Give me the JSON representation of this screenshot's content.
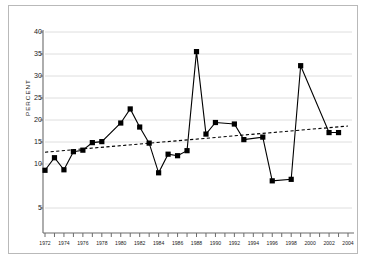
{
  "chart_data": {
    "type": "line",
    "title": "",
    "xlabel": "",
    "ylabel": "PERCENT",
    "ylim": [
      0,
      40
    ],
    "yticks": [
      5,
      10,
      15,
      20,
      25,
      30,
      35,
      40
    ],
    "ytick_labels": [
      "5",
      "10",
      "15",
      "20",
      "25",
      "30",
      "35",
      "40"
    ],
    "xlim": [
      1972,
      2004
    ],
    "xticks": [
      1972,
      1973,
      1974,
      1975,
      1976,
      1977,
      1978,
      1979,
      1980,
      1981,
      1982,
      1983,
      1984,
      1985,
      1986,
      1987,
      1988,
      1989,
      1990,
      1991,
      1992,
      1993,
      1994,
      1995,
      1996,
      1997,
      1998,
      1999,
      2000,
      2001,
      2002,
      2003,
      2004
    ],
    "xtick_labels_shown": [
      "1972",
      "1974",
      "1976",
      "1978",
      "1982",
      "1984",
      "1986",
      "1988",
      "1990",
      "1992",
      "1996",
      "2000",
      "2004"
    ],
    "grid": "horizontal",
    "legend": "none",
    "x": [
      1972,
      1973,
      1974,
      1975,
      1976,
      1977,
      1978,
      1979,
      1980,
      1981,
      1982,
      1983,
      1984,
      1985,
      1986,
      1987,
      1988,
      1989,
      1990,
      1991,
      1992,
      1993,
      1994,
      1995,
      1996,
      1997,
      1998,
      1999,
      2000,
      2001,
      2002,
      2003,
      2004
    ],
    "series": [
      {
        "name": "percent",
        "style": "solid-line-with-square-markers",
        "color": "#000000",
        "x": [
          1972,
          1973,
          1974,
          1975,
          1976,
          1977,
          1978,
          1980,
          1981,
          1982,
          1983,
          1984,
          1985,
          1986,
          1987,
          1988,
          1989,
          1990,
          1992,
          1993,
          1995,
          1996,
          1998,
          1999,
          2002,
          2003
        ],
        "values": [
          12.5,
          15.0,
          12.6,
          16.2,
          16.5,
          18.0,
          18.2,
          21.9,
          24.7,
          21.1,
          17.9,
          12.0,
          15.7,
          15.4,
          16.4,
          36.1,
          19.7,
          22.0,
          21.7,
          18.6,
          19.1,
          10.4,
          10.7,
          33.3,
          20.0,
          20.0
        ]
      },
      {
        "name": "trend",
        "style": "dashed-line",
        "color": "#000000",
        "start_value": 16.1,
        "end_value": 21.3
      }
    ]
  },
  "axis": {
    "y_title": "PERCENT"
  }
}
